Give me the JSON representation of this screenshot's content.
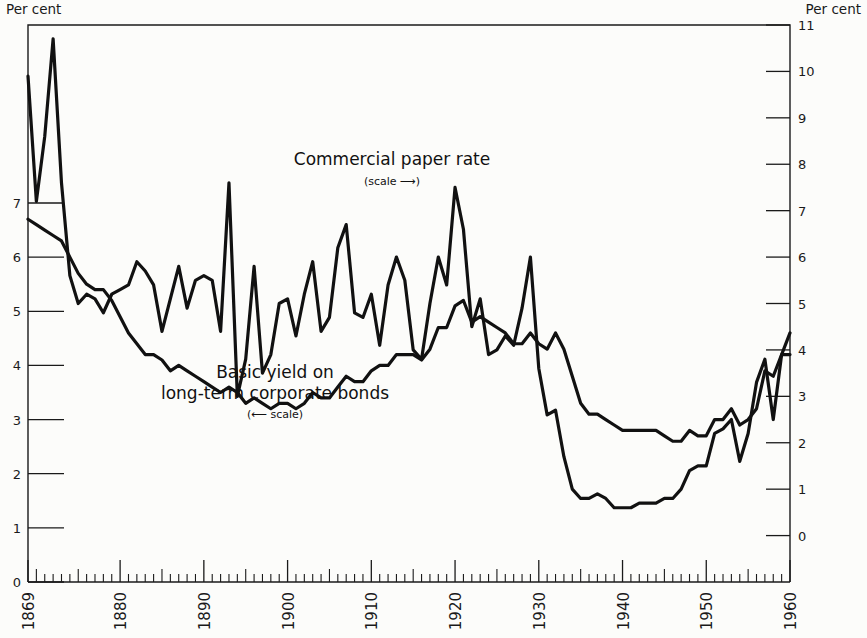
{
  "figure": {
    "left_axis_header": "Per cent",
    "right_axis_header": "Per cent",
    "background": "#fcfcfa",
    "line_color": "#111111"
  },
  "annotations": {
    "commercial_label": "Commercial paper rate",
    "commercial_scale_note": "(scale ⟶)",
    "bonds_label_line1": "Basic yield on",
    "bonds_label_line2": "long-term corporate bonds",
    "bonds_scale_note": "(⟵ scale)"
  },
  "chart_data": {
    "type": "line",
    "title": "",
    "subtitle": "",
    "xlabel": "",
    "ylabel": "Per cent",
    "grid": false,
    "legend_position": "inline-annotation",
    "xlim": [
      1869,
      1960
    ],
    "x_ticks_major": [
      1869,
      1880,
      1890,
      1900,
      1910,
      1920,
      1930,
      1940,
      1950,
      1960
    ],
    "x_tick_labels": [
      "1869",
      "1880",
      "1890",
      "1900",
      "1910",
      "1920",
      "1930",
      "1940",
      "1950",
      "1960"
    ],
    "x_tick_minor_interval": 1,
    "left_axis": {
      "label": "Per cent",
      "ylim": [
        0,
        7
      ],
      "ticks": [
        0,
        1,
        2,
        3,
        4,
        5,
        6,
        7
      ],
      "tick_labels": [
        "0",
        "1",
        "2",
        "3",
        "4",
        "5",
        "6",
        "7"
      ],
      "applies_to": "Basic yield on long-term corporate bonds"
    },
    "right_axis": {
      "label": "Per cent",
      "ylim": [
        -1,
        11
      ],
      "ticks": [
        0,
        1,
        2,
        3,
        4,
        5,
        6,
        7,
        8,
        9,
        10,
        11
      ],
      "tick_labels": [
        "0",
        "1",
        "2",
        "3",
        "4",
        "5",
        "6",
        "7",
        "8",
        "9",
        "10",
        "11"
      ],
      "applies_to": "Commercial paper rate"
    },
    "series": [
      {
        "name": "Commercial paper rate",
        "axis": "right",
        "scale_note": "(scale ⟶)",
        "x": [
          1869,
          1870,
          1871,
          1872,
          1873,
          1874,
          1875,
          1876,
          1877,
          1878,
          1879,
          1880,
          1881,
          1882,
          1883,
          1884,
          1885,
          1886,
          1887,
          1888,
          1889,
          1890,
          1891,
          1892,
          1893,
          1894,
          1895,
          1896,
          1897,
          1898,
          1899,
          1900,
          1901,
          1902,
          1903,
          1904,
          1905,
          1906,
          1907,
          1908,
          1909,
          1910,
          1911,
          1912,
          1913,
          1914,
          1915,
          1916,
          1917,
          1918,
          1919,
          1920,
          1921,
          1922,
          1923,
          1924,
          1925,
          1926,
          1927,
          1928,
          1929,
          1930,
          1931,
          1932,
          1933,
          1934,
          1935,
          1936,
          1937,
          1938,
          1939,
          1940,
          1941,
          1942,
          1943,
          1944,
          1945,
          1946,
          1947,
          1948,
          1949,
          1950,
          1951,
          1952,
          1953,
          1954,
          1955,
          1956,
          1957,
          1958,
          1959,
          1960
        ],
        "values": [
          9.9,
          7.2,
          8.6,
          10.7,
          7.6,
          5.6,
          5.0,
          5.2,
          5.1,
          4.8,
          5.2,
          5.3,
          5.4,
          5.9,
          5.7,
          5.4,
          4.4,
          5.1,
          5.8,
          4.9,
          5.5,
          5.6,
          5.5,
          4.4,
          7.6,
          3.0,
          3.8,
          5.8,
          3.5,
          3.9,
          5.0,
          5.1,
          4.3,
          5.2,
          5.9,
          4.4,
          4.7,
          6.2,
          6.7,
          4.8,
          4.7,
          5.2,
          4.1,
          5.4,
          6.0,
          5.5,
          4.0,
          3.8,
          5.0,
          6.0,
          5.4,
          7.5,
          6.6,
          4.5,
          5.1,
          3.9,
          4.0,
          4.3,
          4.1,
          4.9,
          6.0,
          3.6,
          2.6,
          2.7,
          1.7,
          1.0,
          0.8,
          0.8,
          0.9,
          0.8,
          0.6,
          0.6,
          0.6,
          0.7,
          0.7,
          0.7,
          0.8,
          0.8,
          1.0,
          1.4,
          1.5,
          1.5,
          2.2,
          2.3,
          2.5,
          1.6,
          2.2,
          3.3,
          3.8,
          2.5,
          3.9,
          3.9
        ]
      },
      {
        "name": "Basic yield on long-term corporate bonds",
        "axis": "left",
        "scale_note": "(⟵ scale)",
        "x": [
          1869,
          1870,
          1871,
          1872,
          1873,
          1874,
          1875,
          1876,
          1877,
          1878,
          1879,
          1880,
          1881,
          1882,
          1883,
          1884,
          1885,
          1886,
          1887,
          1888,
          1889,
          1890,
          1891,
          1892,
          1893,
          1894,
          1895,
          1896,
          1897,
          1898,
          1899,
          1900,
          1901,
          1902,
          1903,
          1904,
          1905,
          1906,
          1907,
          1908,
          1909,
          1910,
          1911,
          1912,
          1913,
          1914,
          1915,
          1916,
          1917,
          1918,
          1919,
          1920,
          1921,
          1922,
          1923,
          1924,
          1925,
          1926,
          1927,
          1928,
          1929,
          1930,
          1931,
          1932,
          1933,
          1934,
          1935,
          1936,
          1937,
          1938,
          1939,
          1940,
          1941,
          1942,
          1943,
          1944,
          1945,
          1946,
          1947,
          1948,
          1949,
          1950,
          1951,
          1952,
          1953,
          1954,
          1955,
          1956,
          1957,
          1958,
          1959,
          1960
        ],
        "values": [
          6.7,
          6.6,
          6.5,
          6.4,
          6.3,
          6.0,
          5.7,
          5.5,
          5.4,
          5.4,
          5.2,
          4.9,
          4.6,
          4.4,
          4.2,
          4.2,
          4.1,
          3.9,
          4.0,
          3.9,
          3.8,
          3.7,
          3.6,
          3.5,
          3.6,
          3.5,
          3.3,
          3.4,
          3.3,
          3.2,
          3.3,
          3.3,
          3.2,
          3.3,
          3.5,
          3.4,
          3.4,
          3.6,
          3.8,
          3.7,
          3.7,
          3.9,
          4.0,
          4.0,
          4.2,
          4.2,
          4.2,
          4.1,
          4.3,
          4.7,
          4.7,
          5.1,
          5.2,
          4.8,
          4.9,
          4.8,
          4.7,
          4.6,
          4.4,
          4.4,
          4.6,
          4.4,
          4.3,
          4.6,
          4.3,
          3.8,
          3.3,
          3.1,
          3.1,
          3.0,
          2.9,
          2.8,
          2.8,
          2.8,
          2.8,
          2.8,
          2.7,
          2.6,
          2.6,
          2.8,
          2.7,
          2.7,
          3.0,
          3.0,
          3.2,
          2.9,
          3.0,
          3.2,
          3.9,
          3.8,
          4.2,
          4.6
        ]
      }
    ]
  }
}
